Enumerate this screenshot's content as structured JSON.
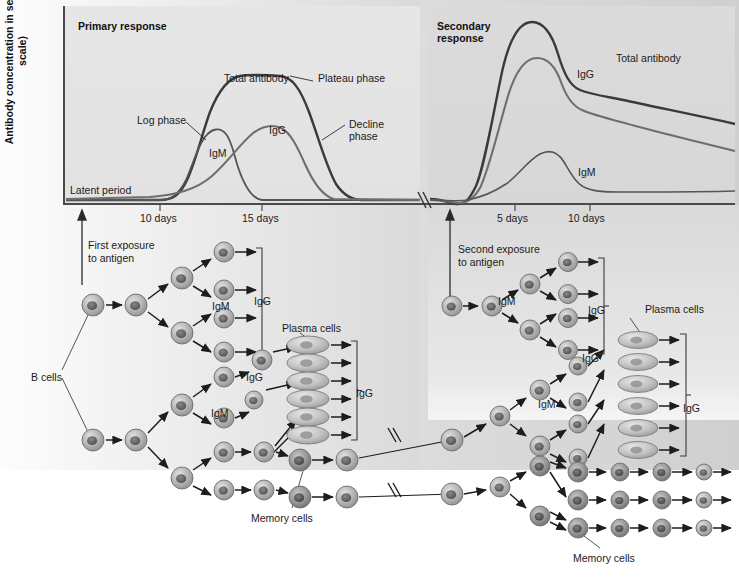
{
  "figure": {
    "y_axis_label": "Antibody concentration\nin serum (log scale)",
    "primary_title": "Primary response",
    "secondary_title": "Secondary response"
  },
  "chart_data": {
    "type": "line",
    "ylabel": "Antibody concentration in serum (log scale)",
    "xlabel": "",
    "grid": false,
    "legend": "inline-annotations",
    "panels": [
      {
        "name": "Primary response",
        "x_ticks": [
          "10 days",
          "15 days"
        ],
        "x_tick_positions": [
          10,
          15
        ],
        "annotations": [
          "Latent period",
          "Log phase",
          "Total antibody",
          "Plateau phase",
          "Decline phase",
          "IgM",
          "IgG"
        ],
        "series": [
          {
            "name": "Total antibody",
            "x": [
              0,
              6,
              8,
              9.5,
              11,
              12.5,
              14,
              15.5,
              17,
              18.5,
              20,
              22
            ],
            "values": [
              2,
              2,
              4,
              18,
              48,
              74,
              82,
              83,
              80,
              52,
              14,
              3
            ]
          },
          {
            "name": "IgM",
            "x": [
              0,
              6,
              8,
              9.5,
              11,
              12,
              13,
              14,
              15.5,
              17,
              19,
              22
            ],
            "values": [
              2,
              2,
              4,
              16,
              40,
              47,
              44,
              30,
              10,
              3,
              2,
              2
            ]
          },
          {
            "name": "IgG",
            "x": [
              0,
              8,
              10,
              12,
              13.5,
              15,
              16,
              17,
              18.5,
              20,
              22
            ],
            "values": [
              2,
              3,
              5,
              14,
              32,
              52,
              57,
              54,
              40,
              14,
              3
            ]
          }
        ]
      },
      {
        "name": "Secondary response",
        "x_ticks": [
          "5 days",
          "10 days"
        ],
        "x_tick_positions": [
          5,
          10
        ],
        "annotations": [
          "Total antibody",
          "IgG",
          "IgM"
        ],
        "series": [
          {
            "name": "Total antibody",
            "x": [
              0,
              1.5,
              2.5,
              3.5,
              4.5,
              5.5,
              6.5,
              7.5,
              9,
              11,
              13,
              15,
              17
            ],
            "values": [
              3,
              1,
              3,
              20,
              62,
              90,
              97,
              92,
              78,
              72,
              66,
              58,
              50
            ]
          },
          {
            "name": "IgG",
            "x": [
              0,
              1.5,
              2.5,
              3.5,
              4.5,
              5.5,
              6.5,
              7.5,
              9,
              11,
              13,
              15,
              17
            ],
            "values": [
              2,
              1,
              2,
              10,
              44,
              70,
              76,
              72,
              63,
              57,
              50,
              44,
              37
            ]
          },
          {
            "name": "IgM",
            "x": [
              0,
              2,
              4,
              6,
              7.5,
              9,
              10,
              11,
              13,
              15,
              17
            ],
            "values": [
              2,
              2,
              4,
              12,
              24,
              30,
              24,
              13,
              9,
              8,
              7
            ]
          }
        ]
      }
    ]
  },
  "diagram": {
    "first_exposure": "First exposure\nto antigen",
    "second_exposure": "Second exposure\nto antigen",
    "b_cells": "B cells",
    "plasma_cells": "Plasma cells",
    "memory_cells": "Memory cells",
    "igm": "IgM",
    "igg": "IgG",
    "left_labels": {
      "igm_top": "IgM",
      "igg_bracket_top": "IgG",
      "igg_mid": "IgG",
      "igm_mid": "IgM",
      "plasma_cells": "Plasma cells",
      "igg_bracket_mid": "IgG",
      "memory_cells": "Memory cells",
      "b_cells": "B cells"
    },
    "right_labels": {
      "igm_top": "IgM",
      "igg_bracket_top": "IgG",
      "igg_mid": "IgG",
      "igm_mid": "IgM",
      "plasma_cells": "Plasma cells",
      "igg_bracket_mid": "IgG",
      "memory_cells": "Memory cells"
    }
  },
  "colors": {
    "total_antibody": "#3a3a3a",
    "igg": "#6e6e6e",
    "igm": "#555555",
    "panel_shade": "#dcdcdc",
    "axis": "#4a4a4a",
    "cell_fill": "#b3b3b3",
    "plasma_fill": "#c3c3c3"
  }
}
